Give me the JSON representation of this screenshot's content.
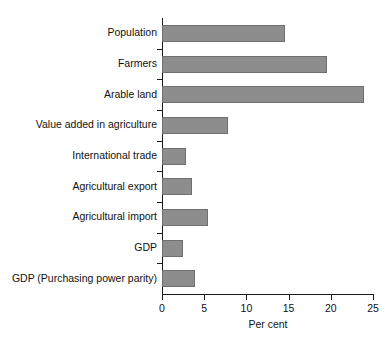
{
  "chart_data": {
    "type": "bar",
    "orientation": "horizontal",
    "title": "",
    "xlabel": "Per cent",
    "ylabel": "",
    "xlim": [
      0,
      25
    ],
    "xticks": [
      0,
      5,
      10,
      15,
      20,
      25
    ],
    "xtick_labels": [
      "0",
      "5",
      "10",
      "15",
      "20",
      "25"
    ],
    "grid": false,
    "legend": null,
    "bar_color": "#8d8d8d",
    "bar_edge_color": "#6f6f6f",
    "axis_color": "#1a1a1a",
    "categories": [
      "Population",
      "Farmers",
      "Arable land",
      "Value added in agriculture",
      "International trade",
      "Agricultural export",
      "Agricultural import",
      "GDP",
      "GDP (Purchasing power parity)"
    ],
    "values": [
      14.6,
      19.6,
      23.9,
      7.8,
      2.9,
      3.6,
      5.4,
      2.5,
      3.9
    ]
  }
}
